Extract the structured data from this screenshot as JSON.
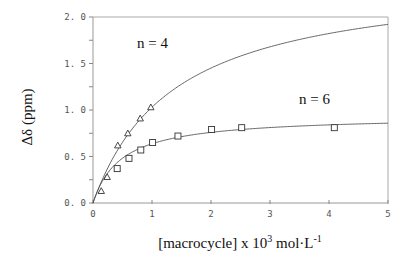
{
  "chart_data": {
    "type": "scatter",
    "title": "",
    "xlabel": "[macrocycle] x 10^3 mol·L^-1",
    "xlabel_parts": {
      "pre": "[macrocycle] x 10",
      "sup1": "3",
      "mid": " mol·L",
      "sup2": "-1"
    },
    "ylabel": "Δδ (ppm)",
    "xlim": [
      0,
      5
    ],
    "ylim": [
      0,
      2.0
    ],
    "x_ticks": [
      "0",
      "1",
      "2",
      "3",
      "4",
      "5"
    ],
    "y_ticks": [
      "0.0",
      "0.5",
      "1.0",
      "1.5",
      "2.0"
    ],
    "grid": false,
    "legend": "none",
    "annotations": [
      {
        "text": "n = 4",
        "x": 0.75,
        "y": 1.68
      },
      {
        "text": "n = 6",
        "x": 3.55,
        "y": 1.1
      }
    ],
    "series": [
      {
        "name": "n = 4",
        "marker": "triangle",
        "x": [
          0.14,
          0.24,
          0.42,
          0.59,
          0.8,
          0.98
        ],
        "y": [
          0.13,
          0.28,
          0.62,
          0.75,
          0.91,
          1.03
        ],
        "fit": {
          "model": "Dmax*K*x/(1+K*x)",
          "Dmax": 2.45,
          "K": 0.726
        }
      },
      {
        "name": "n = 6",
        "marker": "square",
        "x": [
          0.41,
          0.61,
          0.81,
          1.01,
          1.44,
          2.01,
          2.52,
          4.09
        ],
        "y": [
          0.37,
          0.48,
          0.57,
          0.65,
          0.72,
          0.79,
          0.81,
          0.81
        ],
        "fit": {
          "model": "Dmax*K*x/(1+K*x)",
          "Dmax": 0.94,
          "K": 2.1
        }
      }
    ]
  },
  "labels": {
    "n4": "n = 4",
    "n6": "n = 6",
    "ylabel": "Δδ (ppm)",
    "xlabel_pre": "[macrocycle] x 10",
    "xlabel_sup1": "3",
    "xlabel_mid": " mol·L",
    "xlabel_sup2": "-1"
  }
}
